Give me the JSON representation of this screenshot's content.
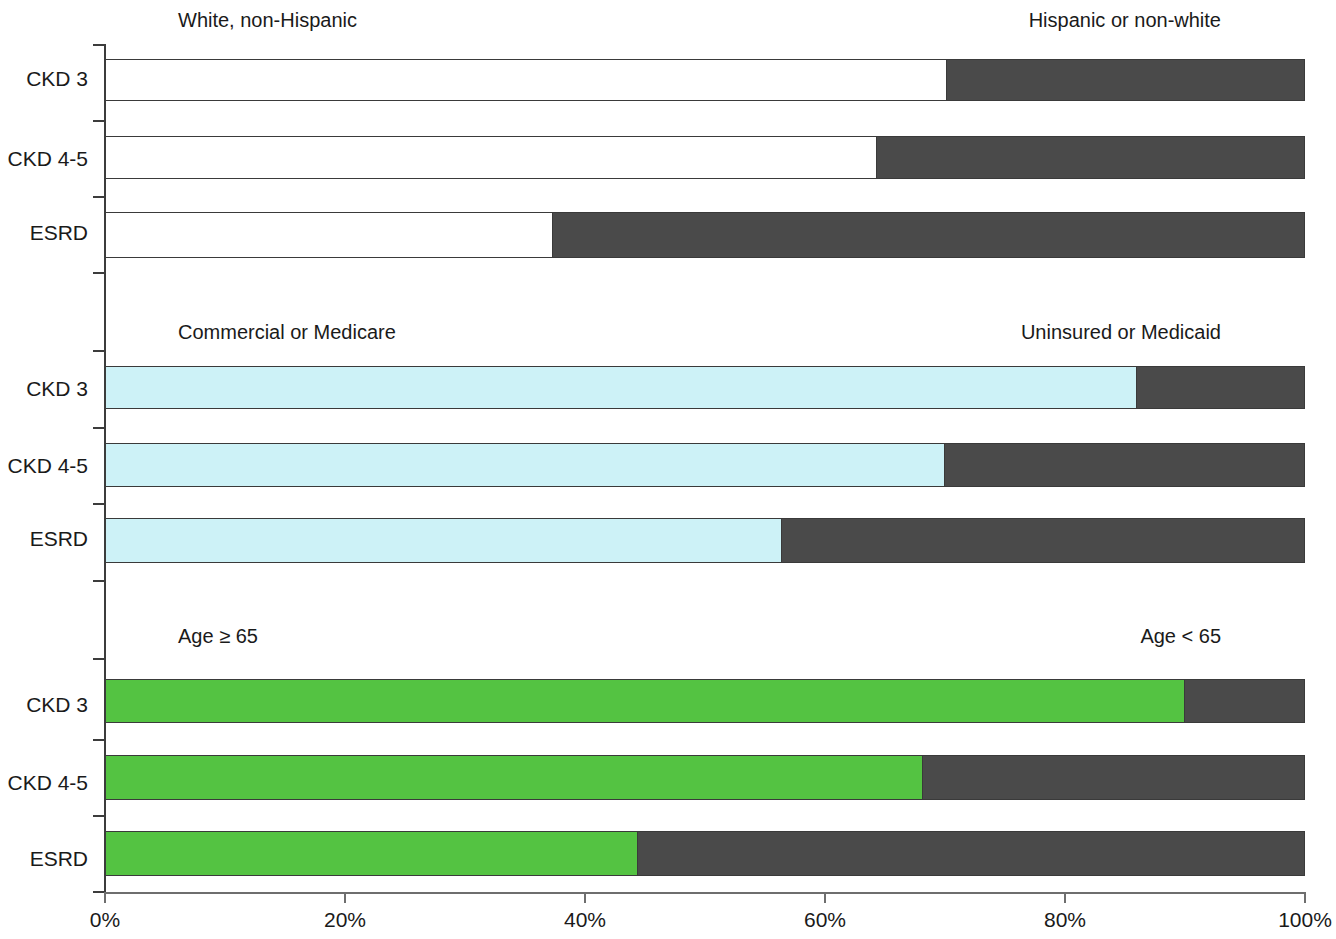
{
  "chart_data": {
    "type": "bar",
    "orientation": "horizontal",
    "stacked": true,
    "normalized_percent": true,
    "title": "",
    "xlabel": "",
    "ylabel": "",
    "xlim": [
      0,
      100
    ],
    "grid": false,
    "legend_position": "panel-headers",
    "categories": [
      "CKD 3",
      "CKD 4-5",
      "ESRD"
    ],
    "x_tick_labels": [
      "0%",
      "20%",
      "40%",
      "60%",
      "80%",
      "100%"
    ],
    "x_tick_values": [
      0,
      20,
      40,
      60,
      80,
      100
    ],
    "panels": [
      {
        "id": "race",
        "left_label": "White, non-Hispanic",
        "right_label": "Hispanic or non-white",
        "left_color": "#ffffff",
        "right_color": "#4a4a4a",
        "series": [
          {
            "name": "White, non-Hispanic",
            "values": [
              70.2,
              64.3,
              37.3
            ]
          },
          {
            "name": "Hispanic or non-white",
            "values": [
              29.8,
              35.7,
              62.7
            ]
          }
        ]
      },
      {
        "id": "insurance",
        "left_label": "Commercial or Medicare",
        "right_label": "Uninsured or Medicaid",
        "left_color": "#cdf2f7",
        "right_color": "#4a4a4a",
        "series": [
          {
            "name": "Commercial or Medicare",
            "values": [
              86.0,
              70.0,
              56.4
            ]
          },
          {
            "name": "Uninsured or Medicaid",
            "values": [
              14.0,
              30.0,
              43.6
            ]
          }
        ]
      },
      {
        "id": "age",
        "left_label": "Age ≥ 65",
        "right_label": "Age < 65",
        "left_color": "#55c màu",
        "left_color_hex": "#54c342",
        "right_color": "#4a4a4a",
        "series": [
          {
            "name": "Age ≥ 65",
            "values": [
              90.0,
              68.2,
              44.4
            ]
          },
          {
            "name": "Age < 65",
            "values": [
              10.0,
              31.8,
              55.6
            ]
          }
        ]
      }
    ]
  },
  "colors": {
    "white_segment": "#ffffff",
    "cyan_segment": "#cdf2f7",
    "green_segment": "#54c342",
    "dark_segment": "#4a4a4a",
    "axis": "#3c3c3c",
    "text": "#1a1a1a"
  }
}
